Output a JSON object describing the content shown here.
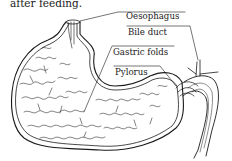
{
  "caption": "after feeding.",
  "labels": [
    {
      "id": "oesophagus",
      "text": "Oesophagus"
    },
    {
      "id": "bile-duct",
      "text": "Bile duct"
    },
    {
      "id": "gastric-folds",
      "text": "Gastric folds"
    },
    {
      "id": "pylorus",
      "text": "Pylorus"
    }
  ],
  "colors": {
    "ink": "#1a1a1a",
    "paper": "#ffffff"
  }
}
